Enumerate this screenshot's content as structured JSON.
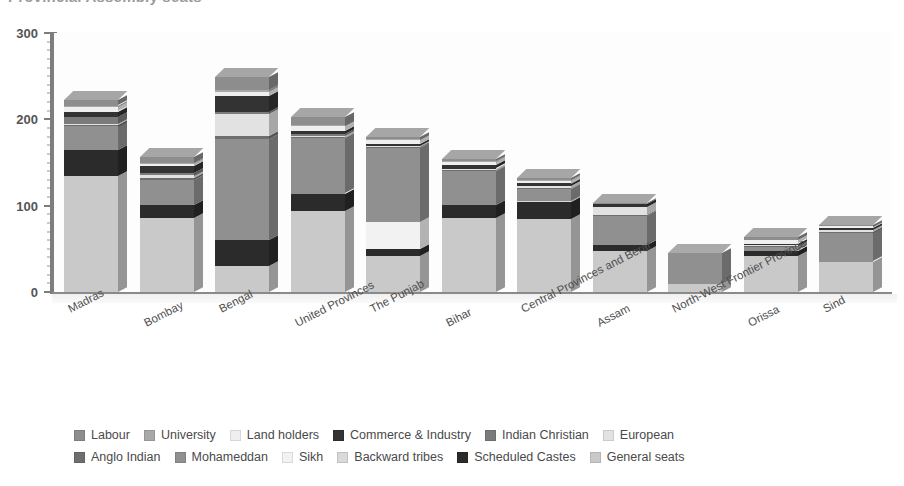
{
  "chart_data": {
    "type": "bar",
    "subtype": "stacked-3d-column",
    "title": "Provincial Assembly seats",
    "xlabel": "",
    "ylabel": "",
    "ylim": [
      0,
      300
    ],
    "yticks": [
      0,
      100,
      200,
      300
    ],
    "ytick_labels": [
      "0",
      "100",
      "200",
      "300"
    ],
    "minor_tick_step": 10,
    "grid": false,
    "legend_position": "bottom",
    "categories": [
      "Madras",
      "Bombay",
      "Bengal",
      "United Provinces",
      "The Punjab",
      "Bihar",
      "Central Provinces and Berar",
      "Assam",
      "North-West Frontier Province",
      "Orissa",
      "Sind"
    ],
    "series": [
      {
        "name": "General seats",
        "color": "#c9c9c9",
        "values": [
          134,
          86,
          30,
          94,
          42,
          86,
          84,
          47,
          9,
          42,
          35
        ]
      },
      {
        "name": "Scheduled Castes",
        "color": "#2b2b2b",
        "values": [
          30,
          15,
          30,
          20,
          8,
          15,
          20,
          7,
          0,
          6,
          0
        ]
      },
      {
        "name": "Backward tribes",
        "color": "#d9d9d9",
        "values": [
          0,
          0,
          0,
          0,
          0,
          0,
          1,
          0,
          0,
          0,
          0
        ]
      },
      {
        "name": "Sikh",
        "color": "#f2f2f2",
        "values": [
          0,
          0,
          0,
          0,
          31,
          0,
          0,
          0,
          0,
          0,
          0
        ]
      },
      {
        "name": "Mohameddan",
        "color": "#909090",
        "values": [
          28,
          29,
          117,
          64,
          86,
          39,
          14,
          34,
          36,
          4,
          34
        ]
      },
      {
        "name": "Anglo Indian",
        "color": "#6e6e6e",
        "values": [
          2,
          2,
          4,
          1,
          1,
          1,
          1,
          1,
          0,
          1,
          1
        ]
      },
      {
        "name": "European",
        "color": "#e2e2e2",
        "values": [
          1,
          3,
          25,
          2,
          1,
          2,
          3,
          9,
          0,
          1,
          2
        ]
      },
      {
        "name": "Indian Christian",
        "color": "#7b7b7b",
        "values": [
          8,
          3,
          2,
          2,
          0,
          0,
          0,
          0,
          0,
          0,
          0
        ]
      },
      {
        "name": "Commerce & Industry",
        "color": "#333333",
        "values": [
          6,
          8,
          19,
          3,
          2,
          4,
          3,
          4,
          0,
          2,
          2
        ]
      },
      {
        "name": "Land holders",
        "color": "#efefef",
        "values": [
          6,
          2,
          5,
          6,
          5,
          4,
          3,
          0,
          0,
          4,
          2
        ]
      },
      {
        "name": "University",
        "color": "#a8a8a8",
        "values": [
          1,
          1,
          2,
          1,
          1,
          1,
          1,
          0,
          0,
          0,
          0
        ]
      },
      {
        "name": "Labour",
        "color": "#8d8d8d",
        "values": [
          6,
          7,
          15,
          10,
          3,
          2,
          2,
          1,
          0,
          4,
          2
        ]
      }
    ],
    "totals": [
      222,
      156,
      249,
      203,
      180,
      154,
      132,
      103,
      45,
      64,
      78
    ]
  },
  "yaxis": {
    "ticks": [
      {
        "label": "300",
        "value": 300
      },
      {
        "label": "200",
        "value": 200
      },
      {
        "label": "100",
        "value": 100
      },
      {
        "label": "0",
        "value": 0
      }
    ]
  },
  "legend": {
    "rows": [
      [
        {
          "label": "Labour",
          "color": "#8d8d8d"
        },
        {
          "label": "University",
          "color": "#a8a8a8"
        },
        {
          "label": "Land holders",
          "color": "#efefef"
        },
        {
          "label": "Commerce & Industry",
          "color": "#333333"
        },
        {
          "label": "Indian Christian",
          "color": "#7b7b7b"
        },
        {
          "label": "European",
          "color": "#e2e2e2"
        }
      ],
      [
        {
          "label": "Anglo Indian",
          "color": "#6e6e6e"
        },
        {
          "label": "Mohameddan",
          "color": "#909090"
        },
        {
          "label": "Sikh",
          "color": "#f2f2f2"
        },
        {
          "label": "Backward tribes",
          "color": "#d9d9d9"
        },
        {
          "label": "Scheduled Castes",
          "color": "#2b2b2b"
        },
        {
          "label": "General seats",
          "color": "#c9c9c9"
        }
      ]
    ]
  }
}
